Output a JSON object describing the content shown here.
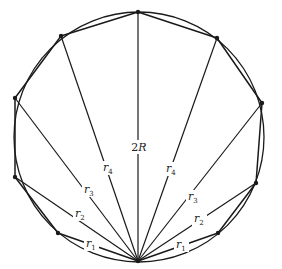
{
  "diagram": {
    "type": "inscribed-polygon-chords",
    "circle": {
      "cx": 139,
      "cy": 137,
      "r": 125
    },
    "base_vertex": {
      "x": 138,
      "y": 261
    },
    "vertices": [
      {
        "x": 58,
        "y": 233
      },
      {
        "x": 15,
        "y": 177
      },
      {
        "x": 15,
        "y": 98
      },
      {
        "x": 61,
        "y": 36
      },
      {
        "x": 138,
        "y": 12
      },
      {
        "x": 217,
        "y": 38
      },
      {
        "x": 262,
        "y": 103
      },
      {
        "x": 256,
        "y": 183
      },
      {
        "x": 218,
        "y": 233
      }
    ],
    "labels": {
      "diameter": {
        "main": "2",
        "italic": "R",
        "x": 139,
        "y": 151
      },
      "left": [
        {
          "name": "r",
          "sub": "1",
          "x": 86,
          "y": 247
        },
        {
          "name": "r",
          "sub": "2",
          "x": 75,
          "y": 217
        },
        {
          "name": "r",
          "sub": "3",
          "x": 84,
          "y": 193
        },
        {
          "name": "r",
          "sub": "4",
          "x": 103,
          "y": 171
        }
      ],
      "right": [
        {
          "name": "r",
          "sub": "1",
          "x": 176,
          "y": 248
        },
        {
          "name": "r",
          "sub": "2",
          "x": 194,
          "y": 222
        },
        {
          "name": "r",
          "sub": "3",
          "x": 188,
          "y": 200
        },
        {
          "name": "r",
          "sub": "4",
          "x": 166,
          "y": 172
        }
      ]
    },
    "colors": {
      "stroke": "#1a1a1a",
      "background": "#ffffff"
    }
  }
}
